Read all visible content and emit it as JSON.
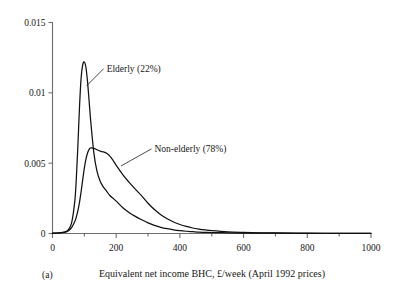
{
  "figure": {
    "panel_label": "(a)",
    "background_color": "#ffffff",
    "curve_color": "#111111",
    "axis_color": "#6e6e6e"
  },
  "chart_data": {
    "type": "line",
    "title": "",
    "subtitle": "",
    "xlabel": "Equivalent net income BHC, £/week (April 1992 prices)",
    "ylabel": "",
    "xlim": [
      0,
      1000
    ],
    "ylim": [
      0,
      0.015
    ],
    "grid": false,
    "legend_position": "inline-annotations",
    "x_ticks": [
      0,
      200,
      400,
      600,
      800,
      1000
    ],
    "x_tick_labels": [
      "0",
      "200",
      "400",
      "600",
      "800",
      "1000"
    ],
    "x_minor_ticks": [
      100,
      300,
      500,
      700,
      900
    ],
    "y_ticks": [
      0,
      0.005,
      0.01,
      0.015
    ],
    "y_tick_labels": [
      "0",
      "0.005",
      "0.01",
      "0.015"
    ],
    "annotations": [
      {
        "text": "Elderly (22%)",
        "x_text": 170,
        "y_text": 0.0115,
        "points_to_x": 107,
        "points_to_y": 0.0105
      },
      {
        "text": "Non-elderly (78%)",
        "x_text": 320,
        "y_text": 0.0058,
        "points_to_x": 215,
        "points_to_y": 0.0048
      }
    ],
    "x": [
      0,
      20,
      40,
      50,
      60,
      70,
      75,
      80,
      85,
      90,
      95,
      100,
      105,
      110,
      115,
      120,
      130,
      140,
      150,
      160,
      170,
      180,
      190,
      200,
      220,
      240,
      260,
      280,
      300,
      320,
      340,
      360,
      380,
      400,
      420,
      440,
      460,
      480,
      500,
      550,
      600,
      650,
      700,
      800,
      900,
      1000
    ],
    "series": [
      {
        "name": "Elderly (22%)",
        "share_percent": 22,
        "values": [
          2e-05,
          4e-05,
          0.00012,
          0.00028,
          0.00075,
          0.0023,
          0.004,
          0.0064,
          0.0091,
          0.0111,
          0.012,
          0.0122,
          0.0118,
          0.0108,
          0.0094,
          0.008,
          0.0057,
          0.0044,
          0.0037,
          0.0033,
          0.003,
          0.0027,
          0.0025,
          0.0023,
          0.00185,
          0.0015,
          0.00122,
          0.00098,
          0.00076,
          0.00058,
          0.00044,
          0.00034,
          0.00026,
          0.0002,
          0.00016,
          0.00013,
          0.0001,
          8e-05,
          7e-05,
          5e-05,
          3e-05,
          2e-05,
          2e-05,
          1e-05,
          1e-05,
          1e-05
        ]
      },
      {
        "name": "Non-elderly (78%)",
        "share_percent": 78,
        "values": [
          2e-05,
          4e-05,
          0.0001,
          0.0002,
          0.00042,
          0.00085,
          0.0012,
          0.00165,
          0.00225,
          0.003,
          0.00385,
          0.00465,
          0.00528,
          0.00572,
          0.00598,
          0.00608,
          0.00605,
          0.00595,
          0.00585,
          0.0058,
          0.0057,
          0.0055,
          0.0052,
          0.00485,
          0.0042,
          0.00365,
          0.00315,
          0.00268,
          0.00215,
          0.0017,
          0.00134,
          0.00105,
          0.00082,
          0.00064,
          0.0005,
          0.00039,
          0.00031,
          0.00025,
          0.0002,
          0.00012,
          8e-05,
          5e-05,
          4e-05,
          2e-05,
          1e-05,
          1e-05
        ]
      }
    ]
  }
}
